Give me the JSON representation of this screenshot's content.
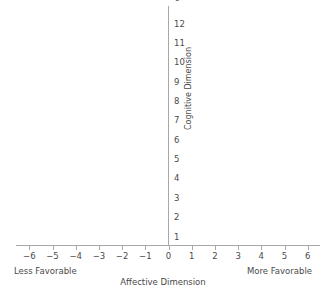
{
  "chart_data": {
    "type": "scatter",
    "title": "Affective Versus Cognitive Scales",
    "xlabel": "Affective Dimension",
    "ylabel": "Cognitive Dimension",
    "x_tick_labels": [
      "−6",
      "−5",
      "−4",
      "−3",
      "−2",
      "−1",
      "0",
      "1",
      "2",
      "3",
      "4",
      "5",
      "6"
    ],
    "x_tick_values": [
      -6,
      -5,
      -4,
      -3,
      -2,
      -1,
      0,
      1,
      2,
      3,
      4,
      5,
      6
    ],
    "y_tick_labels": [
      "1",
      "2",
      "3",
      "4",
      "5",
      "6",
      "7",
      "8",
      "9",
      "10",
      "11",
      "12"
    ],
    "y_tick_values": [
      1,
      2,
      3,
      4,
      5,
      6,
      7,
      8,
      9,
      10,
      11,
      12
    ],
    "xlim": [
      -6.6,
      6.6
    ],
    "ylim": [
      0.4,
      12.6
    ],
    "grid": false,
    "legend": false,
    "series": [
      {
        "name": "observations",
        "x": [],
        "y": []
      }
    ],
    "annotations": [
      {
        "name": "less-favorable",
        "text": "Less Favorable",
        "position": "bottom-left"
      },
      {
        "name": "more-favorable",
        "text": "More Favorable",
        "position": "bottom-right"
      }
    ],
    "axis_color": "#a8a8a8",
    "text_color": "#4a4a4a",
    "background_color": "#ffffff"
  }
}
